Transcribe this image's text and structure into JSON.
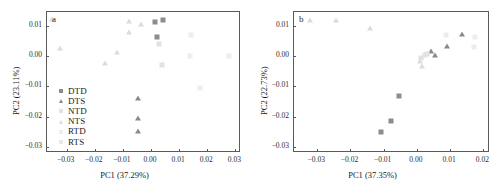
{
  "figure": {
    "type": "scatter-pca-panels",
    "panels": [
      "a",
      "b"
    ]
  },
  "series_styles": {
    "DTD": {
      "shape": "square",
      "color": "#8c8c8c"
    },
    "DTS": {
      "shape": "triangle",
      "color": "#8a8a8a"
    },
    "NTD": {
      "shape": "square",
      "color": "#e2e2e2"
    },
    "NTS": {
      "shape": "triangle",
      "color": "#dcdcdc"
    },
    "RTD": {
      "shape": "square",
      "color": "#ededed"
    },
    "RTS": {
      "shape": "square",
      "color": "#e8e8e8"
    }
  },
  "legend": {
    "entries": [
      {
        "label": "DTD",
        "shape": "square",
        "color": "#8c8c8c"
      },
      {
        "label": "DTS",
        "shape": "triangle",
        "color": "#8a8a8a"
      },
      {
        "label": "NTD",
        "shape": "square",
        "color": "#e2e2e2"
      },
      {
        "label": "NTS",
        "shape": "triangle",
        "color": "#dcdcdc"
      },
      {
        "label": "RTD",
        "shape": "square",
        "color": "#ededed"
      },
      {
        "label": "RTS",
        "shape": "square",
        "color": "#e8e8e8"
      }
    ]
  },
  "chart_data": [
    {
      "type": "scatter",
      "panel_label": "a",
      "title": "",
      "xlabel": "PC1 (37.29%)",
      "ylabel": "PC2 (23.11%)",
      "xlim": [
        -0.037,
        0.032
      ],
      "ylim": [
        -0.032,
        0.0145
      ],
      "xticks": [
        -0.03,
        -0.02,
        -0.01,
        0.0,
        0.01,
        0.02,
        0.03
      ],
      "xticklabels": [
        "−0.03",
        "−0.02",
        "−0.01",
        "0.00",
        "0.01",
        "0.02",
        "0.03"
      ],
      "yticks": [
        0.01,
        0.0,
        -0.01,
        -0.02,
        -0.03
      ],
      "yticklabels": [
        "0.01",
        "0.00",
        "−0.01",
        "−0.02",
        "−0.03"
      ],
      "grid": false,
      "legend_position": "lower-left",
      "series": [
        {
          "name": "DTD",
          "points": [
            [
              0.0015,
              0.0112
            ],
            [
              0.0042,
              0.0118
            ],
            [
              0.0022,
              0.0064
            ]
          ]
        },
        {
          "name": "DTS",
          "points": [
            [
              -0.0045,
              -0.0138
            ],
            [
              -0.0047,
              -0.0203
            ],
            [
              -0.0046,
              -0.0249
            ]
          ]
        },
        {
          "name": "NTD",
          "points": [
            [
              0.0029,
              0.004
            ],
            [
              0.0038,
              -0.0031
            ]
          ]
        },
        {
          "name": "NTS",
          "points": [
            [
              -0.0353,
              0.0121
            ],
            [
              -0.0323,
              0.0027
            ],
            [
              -0.0162,
              -0.0022
            ],
            [
              -0.012,
              0.0014
            ],
            [
              -0.0078,
              0.0114
            ],
            [
              -0.0077,
              0.008
            ],
            [
              -0.0035,
              0.0107
            ]
          ]
        },
        {
          "name": "RTD",
          "points": [
            [
              0.0141,
              0.007
            ],
            [
              0.0138,
              0.0001
            ],
            [
              0.0175,
              -0.0106
            ],
            [
              0.0278,
              0.0
            ]
          ]
        },
        {
          "name": "RTS",
          "points": []
        }
      ]
    },
    {
      "type": "scatter",
      "panel_label": "b",
      "title": "",
      "xlabel": "PC1 (37.35%)",
      "ylabel": "PC2 (22.73%)",
      "xlim": [
        -0.037,
        0.022
      ],
      "ylim": [
        -0.032,
        0.0145
      ],
      "xticks": [
        -0.03,
        -0.02,
        -0.01,
        0.0,
        0.01,
        0.02
      ],
      "xticklabels": [
        "−0.03",
        "−0.02",
        "−0.01",
        "0.00",
        "0.01",
        "0.02"
      ],
      "yticks": [
        0.01,
        0.0,
        -0.01,
        -0.02,
        -0.03
      ],
      "yticklabels": [
        "0.01",
        "0.00",
        "−0.01",
        "−0.02",
        "−0.03"
      ],
      "grid": false,
      "legend_position": "lower-left",
      "series": [
        {
          "name": "DTD",
          "points": [
            [
              -0.0108,
              -0.0251
            ],
            [
              -0.0077,
              -0.0214
            ],
            [
              -0.0055,
              -0.0132
            ]
          ]
        },
        {
          "name": "DTS",
          "points": [
            [
              0.0055,
              0.0003
            ],
            [
              0.0042,
              0.0017
            ],
            [
              0.0092,
              0.0034
            ],
            [
              0.0137,
              0.0071
            ]
          ]
        },
        {
          "name": "NTD",
          "points": [
            [
              0.0012,
              -0.0008
            ],
            [
              0.0024,
              0.0002
            ],
            [
              0.0031,
              0.0006
            ]
          ]
        },
        {
          "name": "NTS",
          "points": [
            [
              -0.0322,
              0.0118
            ],
            [
              -0.0243,
              0.0117
            ],
            [
              -0.0142,
              0.0092
            ],
            [
              0.0014,
              -0.0033
            ],
            [
              0.0009,
              -0.0015
            ]
          ]
        },
        {
          "name": "RTD",
          "points": [
            [
              0.0089,
              0.0069
            ],
            [
              0.0175,
              0.0063
            ],
            [
              0.0172,
              0.0031
            ]
          ]
        },
        {
          "name": "RTS",
          "points": []
        }
      ]
    }
  ]
}
